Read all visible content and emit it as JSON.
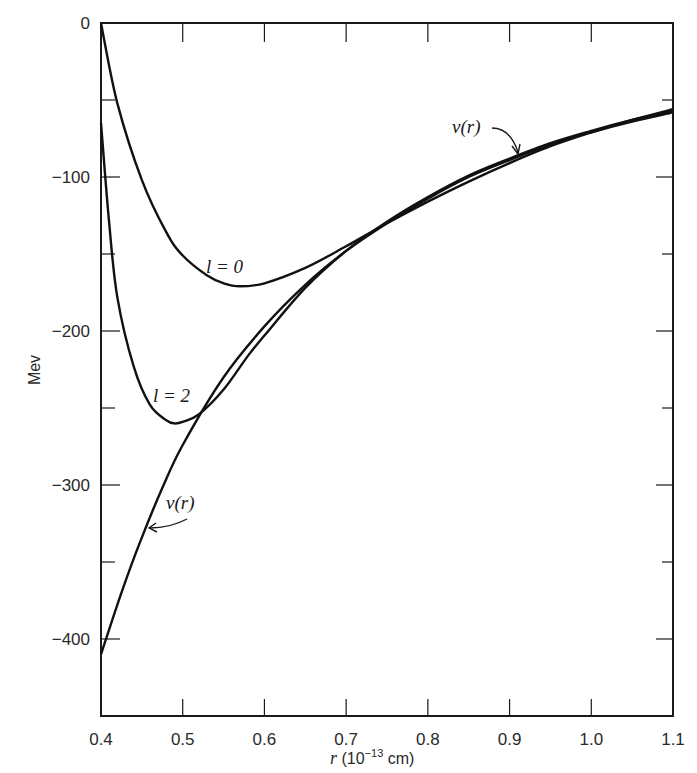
{
  "chart_data": {
    "type": "line",
    "title": "",
    "xlabel": "r (10^-13 cm)",
    "xlabel_parts": {
      "main": "r (10",
      "sup": "−13",
      "tail": " cm)"
    },
    "ylabel": "Mev",
    "xlim": [
      0.4,
      1.1
    ],
    "ylim": [
      -450,
      0
    ],
    "grid": false,
    "legend": "none (inline curve labels)",
    "x_ticks": [
      "0.4",
      "0.5",
      "0.6",
      "0.7",
      "0.8",
      "0.9",
      "1.0",
      "1.1"
    ],
    "y_ticks": [
      "0",
      "−100",
      "−200",
      "−300",
      "−400"
    ],
    "y_tick_values": [
      0,
      -100,
      -200,
      -300,
      -400
    ],
    "y_minor_ticks": [
      -50,
      -150,
      -250,
      -350
    ],
    "series": [
      {
        "name": "l = 0",
        "x": [
          0.4,
          0.42,
          0.45,
          0.48,
          0.5,
          0.53,
          0.55,
          0.57,
          0.6,
          0.65,
          0.7,
          0.75,
          0.8,
          0.85,
          0.9,
          0.95,
          1.0,
          1.05,
          1.1
        ],
        "y": [
          0,
          -52,
          -102,
          -136,
          -151,
          -164,
          -169,
          -171,
          -169,
          -159,
          -145,
          -130,
          -116,
          -103,
          -91,
          -80,
          -71,
          -63,
          -56
        ]
      },
      {
        "name": "l = 2",
        "x": [
          0.4,
          0.41,
          0.42,
          0.44,
          0.46,
          0.48,
          0.49,
          0.5,
          0.52,
          0.55,
          0.58,
          0.6,
          0.65,
          0.7,
          0.75,
          0.8,
          0.85,
          0.9,
          0.95,
          1.0,
          1.05,
          1.1
        ],
        "y": [
          -65,
          -130,
          -178,
          -223,
          -248,
          -258,
          -260,
          -259,
          -254,
          -238,
          -216,
          -203,
          -172,
          -148,
          -129,
          -113,
          -99,
          -88,
          -78,
          -70,
          -63,
          -57
        ]
      },
      {
        "name": "v(r)",
        "x": [
          0.4,
          0.425,
          0.45,
          0.475,
          0.5,
          0.55,
          0.6,
          0.65,
          0.7,
          0.75,
          0.8,
          0.85,
          0.9,
          0.95,
          1.0,
          1.05,
          1.1
        ],
        "y": [
          -410,
          -370,
          -334,
          -302,
          -274,
          -230,
          -197,
          -170,
          -148,
          -130,
          -114,
          -100,
          -89,
          -79,
          -71,
          -64,
          -58
        ]
      }
    ],
    "annotations": [
      {
        "text": "l = 0",
        "x": 0.575,
        "y": -155
      },
      {
        "text": "l = 2",
        "x": 0.47,
        "y": -245
      },
      {
        "text": "v(r)",
        "x": 0.47,
        "y": -310,
        "arrow_to": [
          0.455,
          -327
        ]
      },
      {
        "text": "v(r)",
        "x": 0.86,
        "y": -65,
        "arrow_to": [
          0.89,
          -86
        ]
      }
    ]
  },
  "labels": {
    "curve_l0": "l = 0",
    "curve_l2": "l = 2",
    "v_lower": "v(r)",
    "v_upper": "v(r)"
  }
}
